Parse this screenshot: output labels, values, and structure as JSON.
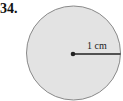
{
  "problem": {
    "number": "34."
  },
  "figure": {
    "shape": "circle",
    "radius_label": "1 cm",
    "fill_color": "#e3e3e3",
    "stroke_color": "#8a8a8a",
    "line_color": "#222222"
  }
}
